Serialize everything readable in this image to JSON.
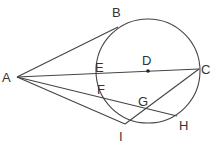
{
  "diagram": {
    "type": "geometry",
    "circle": {
      "center": "D",
      "cx": 148,
      "cy": 71,
      "r": 52
    },
    "points": {
      "A": {
        "x": 17,
        "y": 77,
        "label": "A",
        "lx": 2,
        "ly": 82
      },
      "B": {
        "x": 118,
        "y": 27,
        "label": "B",
        "lx": 113,
        "ly": 17
      },
      "C": {
        "x": 199,
        "y": 69,
        "label": "C",
        "lx": 202,
        "ly": 74
      },
      "D": {
        "x": 148,
        "y": 71,
        "label": "D",
        "lx": 142,
        "ly": 65
      },
      "E": {
        "x": 97,
        "y": 74,
        "label": "E",
        "lx": 96,
        "ly": 71
      },
      "F": {
        "x": 101,
        "y": 88,
        "label": "F",
        "lx": 98,
        "ly": 94
      },
      "G": {
        "x": 145,
        "y": 109,
        "label": "G",
        "lx": 138,
        "ly": 106
      },
      "H": {
        "x": 177,
        "y": 116,
        "label": "H",
        "lx": 180,
        "ly": 129
      },
      "I": {
        "x": 125,
        "y": 124,
        "label": "I",
        "lx": 120,
        "ly": 140
      }
    },
    "segments": [
      [
        "A",
        "B"
      ],
      [
        "A",
        "C"
      ],
      [
        "A",
        "H"
      ],
      [
        "A",
        "I"
      ],
      [
        "C",
        "I"
      ]
    ]
  }
}
